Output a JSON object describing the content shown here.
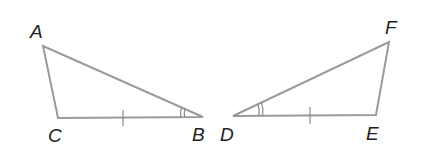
{
  "diagram": {
    "type": "congruent-triangles",
    "stroke_color": "#9a9a9a",
    "label_color": "#222222",
    "triangles": [
      {
        "name": "triangle-ABC",
        "vertices": {
          "A": {
            "label": "A",
            "x": 43,
            "y": 46,
            "label_x": 30,
            "label_y": 38
          },
          "B": {
            "label": "B",
            "x": 203,
            "y": 117,
            "label_x": 192,
            "label_y": 141
          },
          "C": {
            "label": "C",
            "x": 58,
            "y": 118,
            "label_x": 48,
            "label_y": 142
          }
        },
        "tick_side": "CB",
        "angle_mark": "B",
        "angle_arcs": 2
      },
      {
        "name": "triangle-DEF",
        "vertices": {
          "D": {
            "label": "D",
            "x": 233,
            "y": 116,
            "label_x": 220,
            "label_y": 141
          },
          "E": {
            "label": "E",
            "x": 376,
            "y": 115,
            "label_x": 366,
            "label_y": 140
          },
          "F": {
            "label": "F",
            "x": 389,
            "y": 42,
            "label_x": 385,
            "label_y": 34
          }
        },
        "tick_side": "DE",
        "angle_mark": "D",
        "angle_arcs": 2
      }
    ],
    "labels": {
      "A": "A",
      "B": "B",
      "C": "C",
      "D": "D",
      "E": "E",
      "F": "F"
    }
  }
}
